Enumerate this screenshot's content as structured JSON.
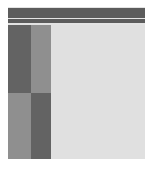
{
  "window": {
    "title": "Application Window",
    "background_color": "#ffffff",
    "panel_color": "#e3e3e3"
  },
  "header": {
    "primary_bar_label": "Title Bar",
    "secondary_bar_label": "Toolbar",
    "bar_color": "#5c5c5c"
  },
  "sidebar": {
    "label": "Navigation Sidebar",
    "dark_color": "#636363",
    "medium_color": "#8f8f8f",
    "cells": [
      {
        "label": "Sidebar Panel Top Left",
        "shade": "dark"
      },
      {
        "label": "Sidebar Panel Top Right",
        "shade": "medium"
      },
      {
        "label": "Sidebar Panel Bottom Left",
        "shade": "medium"
      },
      {
        "label": "Sidebar Panel Bottom Right",
        "shade": "dark"
      }
    ]
  },
  "main": {
    "label": "Main Content Area",
    "background_color": "#e0e0e0"
  }
}
